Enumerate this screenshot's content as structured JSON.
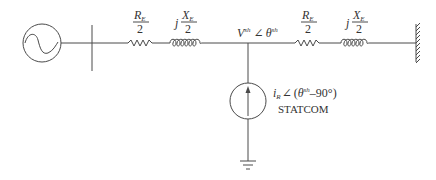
{
  "diagram": {
    "type": "single-line power circuit",
    "source": {
      "icon": "ac-source-icon"
    },
    "segment_left": {
      "resistor_label": {
        "num": "R",
        "num_sub": "E",
        "den": "2"
      },
      "reactance_label": {
        "prefix": "j",
        "num": "X",
        "num_sub": "E",
        "den": "2"
      }
    },
    "bus_voltage": {
      "symbol": "V",
      "sup": "sh",
      "angle_symbol": "∠",
      "theta": "θ",
      "theta_sup": "sh"
    },
    "segment_right": {
      "resistor_label": {
        "num": "R",
        "num_sub": "E",
        "den": "2"
      },
      "reactance_label": {
        "prefix": "j",
        "num": "X",
        "num_sub": "E",
        "den": "2"
      }
    },
    "shunt_device": {
      "current_symbol": "i",
      "current_sub": "R",
      "angle_symbol": "∠",
      "open_paren": "(",
      "theta": "θ",
      "theta_sup": "sh",
      "offset": "–90°)",
      "name": "STATCOM"
    },
    "infinite_bus": {
      "icon": "ground-wall-icon"
    },
    "ground": {
      "icon": "ground-icon"
    }
  }
}
